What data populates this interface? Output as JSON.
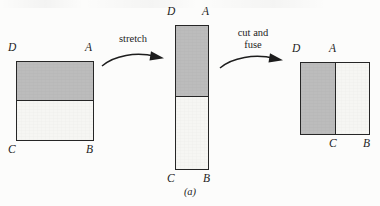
{
  "figure": {
    "caption": "(a)",
    "background_color": "#fcfcfb",
    "shaded_color": "#bcbcbc",
    "unshaded_color": "#f6f6f3",
    "stroke_color": "#262626"
  },
  "shapes": [
    {
      "id": "square-original",
      "name": "original-square",
      "shading": "top-half",
      "labels": {
        "top_left": "D",
        "top_right": "A",
        "bottom_left": "C",
        "bottom_right": "B"
      }
    },
    {
      "id": "rect-stretched",
      "name": "stretched-rectangle",
      "shading": "top-half",
      "labels": {
        "top_left": "D",
        "top_right": "A",
        "bottom_left": "C",
        "bottom_right": "B"
      }
    },
    {
      "id": "square-fused",
      "name": "cut-and-fused-square",
      "shading": "left-half",
      "labels": {
        "top_left": "D",
        "top_middle": "A",
        "bottom_middle": "C",
        "bottom_right": "B"
      }
    }
  ],
  "arrows": [
    {
      "id": "arrow-stretch",
      "name": "stretch-arrow",
      "label": "stretch"
    },
    {
      "id": "arrow-cut-fuse",
      "name": "cut-and-fuse-arrow",
      "label": "cut and\nfuse"
    }
  ]
}
